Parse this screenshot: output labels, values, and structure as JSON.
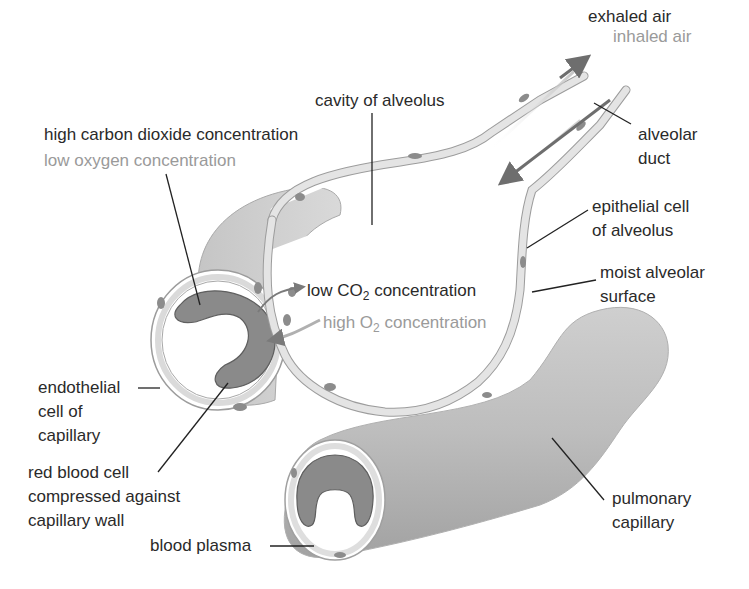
{
  "diagram": {
    "labels": {
      "exhaled_air": "exhaled air",
      "inhaled_air": "inhaled air",
      "cavity_of_alveolus": "cavity of alveolus",
      "alveolar_duct_1": "alveolar",
      "alveolar_duct_2": "duct",
      "high_co2": "high carbon dioxide concentration",
      "low_o2": "low oxygen concentration",
      "epithelial_1": "epithelial cell",
      "epithelial_2": "of alveolus",
      "moist_1": "moist alveolar",
      "moist_2": "surface",
      "low_co2_prefix": "low CO",
      "low_co2_sub": "2",
      "low_co2_suffix": " concentration",
      "high_o2_prefix": "high O",
      "high_o2_sub": "2",
      "high_o2_suffix": " concentration",
      "endothelial_1": "endothelial",
      "endothelial_2": "cell of",
      "endothelial_3": "capillary",
      "rbc_1": "red blood cell",
      "rbc_2": "compressed against",
      "rbc_3": "capillary wall",
      "blood_plasma": "blood plasma",
      "pulmonary_1": "pulmonary",
      "pulmonary_2": "capillary"
    },
    "colors": {
      "label_dark": "#2a2a2a",
      "label_grey": "#9a9a9a",
      "membrane": "#e4e4e4",
      "membrane_edge": "#9c9c9c",
      "nucleus": "#8c8c8c",
      "red_blood_cell": "#8a8a8a",
      "capillary_body": "#bdbdbd",
      "arrow": "#6e6e6e"
    }
  }
}
